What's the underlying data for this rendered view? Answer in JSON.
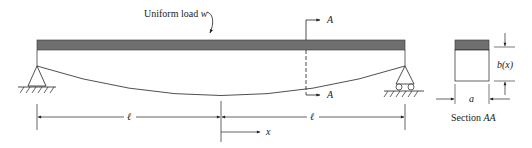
{
  "labels": {
    "load_text": "Uniform load ",
    "load_symbol": "w",
    "section_top": "A",
    "section_bottom": "A",
    "span_left": "ℓ",
    "span_right": "ℓ",
    "x_axis": "x",
    "depth": "b(x)",
    "width": "a",
    "section_caption_prefix": "Section ",
    "section_caption_name": "AA"
  },
  "colors": {
    "beam_fill": "#6f6f6f",
    "line": "#222222",
    "background": "#ffffff"
  }
}
